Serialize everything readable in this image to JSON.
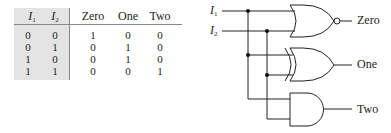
{
  "table": {
    "headers": [
      {
        "base": "I",
        "sub": "1"
      },
      {
        "base": "I",
        "sub": "2"
      },
      {
        "text": "Zero"
      },
      {
        "text": "One"
      },
      {
        "text": "Two"
      }
    ],
    "rows": [
      [
        "0",
        "0",
        "1",
        "0",
        "0"
      ],
      [
        "0",
        "1",
        "0",
        "1",
        "0"
      ],
      [
        "1",
        "0",
        "0",
        "1",
        "0"
      ],
      [
        "1",
        "1",
        "0",
        "0",
        "1"
      ]
    ]
  },
  "circuit": {
    "inputs": [
      {
        "base": "I",
        "sub": "1"
      },
      {
        "base": "I",
        "sub": "2"
      }
    ],
    "outputs": [
      "Zero",
      "One",
      "Two"
    ],
    "gates": [
      "NOR",
      "XOR",
      "AND"
    ]
  }
}
